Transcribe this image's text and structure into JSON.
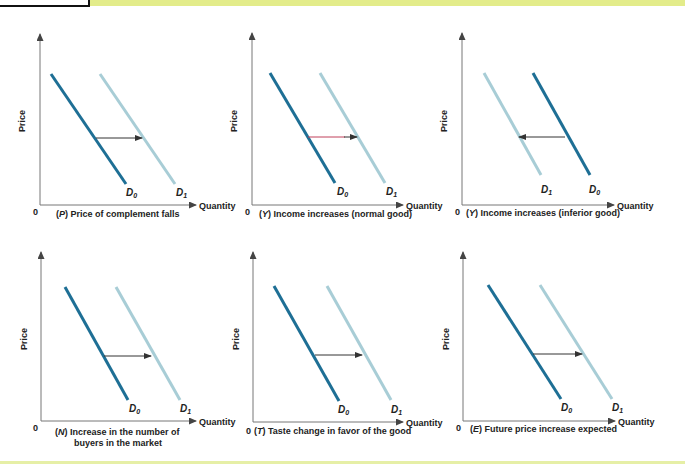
{
  "page": {
    "top_band_color": "#e3ec8a",
    "bottom_band_color": "#e6efa6"
  },
  "colors": {
    "d0": "#1e6f95",
    "d1": "#a8cdd6",
    "arrow": "#333333",
    "arrow_accent": "#c0415b"
  },
  "axis_labels": {
    "y": "Price",
    "x": "Quantity",
    "origin": "0"
  },
  "panels": [
    {
      "id": "P",
      "caption_letter": "P",
      "caption_text": " Price of complement falls",
      "caption_line2": "",
      "d0": "D",
      "d0_sub": "0",
      "d1": "D",
      "d1_sub": "1",
      "shift": "right"
    },
    {
      "id": "Y1",
      "caption_letter": "Y",
      "caption_text": " Income increases (normal good)",
      "caption_line2": "",
      "d0": "D",
      "d0_sub": "0",
      "d1": "D",
      "d1_sub": "1",
      "shift": "right"
    },
    {
      "id": "Y2",
      "caption_letter": "Y",
      "caption_text": " Income increases (inferior good)",
      "caption_line2": "",
      "d0": "D",
      "d0_sub": "0",
      "d1": "D",
      "d1_sub": "1",
      "shift": "left"
    },
    {
      "id": "N",
      "caption_letter": "N",
      "caption_text": " Increase in the number of",
      "caption_line2": "buyers in the market",
      "d0": "D",
      "d0_sub": "0",
      "d1": "D",
      "d1_sub": "1",
      "shift": "right"
    },
    {
      "id": "T",
      "caption_letter": "T",
      "caption_text": " Taste change in favor of the good",
      "caption_line2": "",
      "d0": "D",
      "d0_sub": "0",
      "d1": "D",
      "d1_sub": "1",
      "shift": "right"
    },
    {
      "id": "E",
      "caption_letter": "E",
      "caption_text": " Future price increase expected",
      "caption_line2": "",
      "d0": "D",
      "d0_sub": "0",
      "d1": "D",
      "d1_sub": "1",
      "shift": "right"
    }
  ]
}
